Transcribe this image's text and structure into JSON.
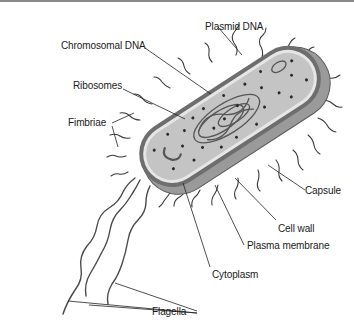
{
  "labels": {
    "plasmid_dna": "Plasmid DNA",
    "chromosomal_dna": "Chromosomal DNA",
    "ribosomes": "Ribosomes",
    "fimbriae": "Fimbriae",
    "capsule": "Capsule",
    "cell_wall": "Cell wall",
    "plasma_membrane": "Plasma membrane",
    "cytoplasm": "Cytoplasm",
    "flagella": "Flagella"
  },
  "colors": {
    "capsule": "#9a9a9a",
    "cell_wall": "#6e6e6e",
    "plasma_membrane": "#e6e6e6",
    "cytoplasm": "#c4c4c4",
    "ribosome": "#2a2a2a",
    "line": "#222222",
    "text": "#1a1a1a"
  }
}
